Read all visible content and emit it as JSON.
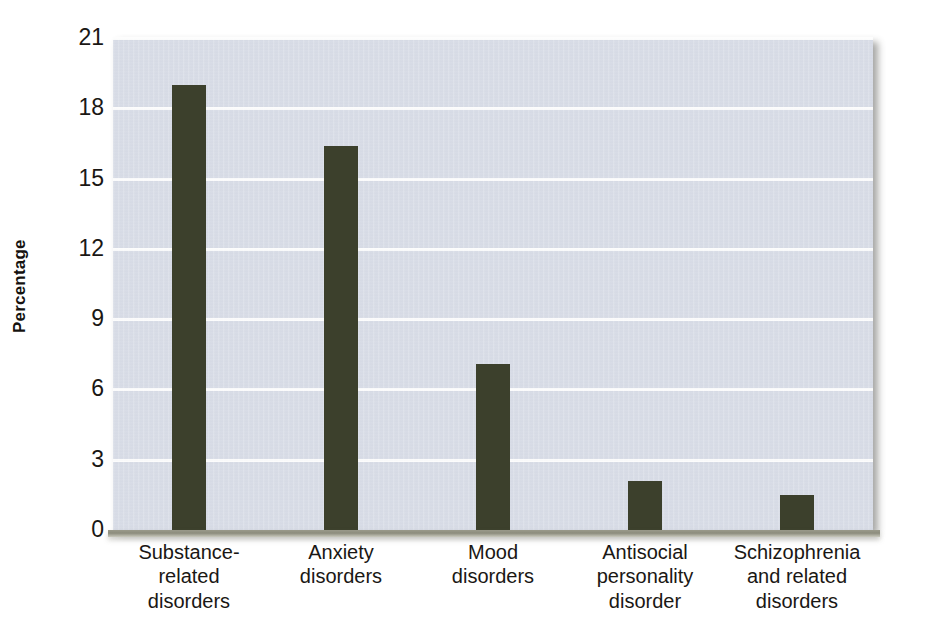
{
  "chart_data": {
    "type": "bar",
    "title": "",
    "xlabel": "",
    "ylabel": "Percentage",
    "ylim": [
      0,
      21
    ],
    "yticks": [
      21,
      18,
      15,
      12,
      9,
      6,
      3,
      0
    ],
    "grid": true,
    "legend": "none",
    "bar_color": "#3c402c",
    "plot_background": "#d9dde7",
    "gridline_color": "#fdfdfd",
    "categories": [
      "Substance-related disorders",
      "Anxiety disorders",
      "Mood disorders",
      "Antisocial personality disorder",
      "Schizophrenia and related disorders"
    ],
    "category_lines": [
      [
        "Substance-",
        "related",
        "disorders"
      ],
      [
        "Anxiety",
        "disorders"
      ],
      [
        "Mood",
        "disorders"
      ],
      [
        "Antisocial",
        "personality",
        "disorder"
      ],
      [
        "Schizophrenia",
        "and related",
        "disorders"
      ]
    ],
    "values": [
      19.0,
      16.4,
      7.1,
      2.1,
      1.5
    ]
  }
}
